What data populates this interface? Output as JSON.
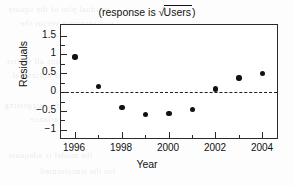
{
  "chart_data": {
    "type": "scatter",
    "title": "(response is √Users)",
    "title_prefix": "(response is ",
    "title_radical": "√",
    "title_radicand": "Users",
    "title_suffix": ")",
    "xlabel": "Year",
    "ylabel": "Residuals",
    "x": [
      1996,
      1997,
      1998,
      1999,
      2000,
      2001,
      2002,
      2003,
      2004
    ],
    "values": [
      0.93,
      0.14,
      -0.42,
      -0.6,
      -0.58,
      -0.47,
      0.08,
      0.37,
      0.49
    ],
    "xlim": [
      1995.4,
      2004.7
    ],
    "ylim": [
      -1.28,
      1.78
    ],
    "xticks_major": [
      1996,
      1998,
      2000,
      2002,
      2004
    ],
    "xticks_minor": [
      1997,
      1999,
      2001,
      2003
    ],
    "xtick_labels": [
      "1996",
      "1998",
      "2000",
      "2002",
      "2004"
    ],
    "yticks_major": [
      1.5,
      1,
      0.5,
      0,
      -0.5,
      -1
    ],
    "ytick_labels": [
      "1.5",
      "1",
      "0.5",
      "0",
      "−0.5",
      "−1"
    ],
    "yticks_minor": [
      1.25,
      0.75,
      0.25,
      -0.25,
      -0.75
    ],
    "reference_line": 0,
    "reference_line_style": "dashed",
    "grid": false,
    "legend": null,
    "marker": "filled-circle",
    "marker_color": "#111111",
    "frame_color": "#2b2b2b",
    "background": "#ffffff"
  },
  "ghost_text": [
    "residual plot of the square",
    "root response versus the",
    "number of users",
    "shows the points all scatter",
    "randomly about the horizontal",
    "line at zero, suggesting",
    "a constant variance",
    "the model is adequate",
    "for the transformed"
  ]
}
